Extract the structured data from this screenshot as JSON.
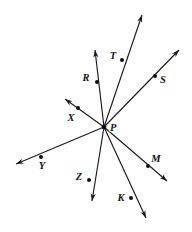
{
  "figure": {
    "type": "geometry-diagram",
    "width": 192,
    "height": 232,
    "background_color": "#ffffff",
    "line_color": "#1a1a1a",
    "label_color": "#141414",
    "vertex": {
      "label": "P",
      "x": 104,
      "y": 127,
      "label_x": 110,
      "label_y": 131
    },
    "rays": [
      {
        "label": "R",
        "name": "ray-PR",
        "point_x": 97,
        "point_y": 82,
        "tip_x": 95,
        "tip_y": 50,
        "label_x": 86,
        "label_y": 81
      },
      {
        "label": "T",
        "name": "ray-PT",
        "point_x": 122,
        "point_y": 60,
        "tip_x": 142,
        "tip_y": 15,
        "label_x": 113,
        "label_y": 59
      },
      {
        "label": "S",
        "name": "ray-PS",
        "point_x": 155,
        "point_y": 76,
        "tip_x": 179,
        "tip_y": 50,
        "label_x": 163,
        "label_y": 83
      },
      {
        "label": "X",
        "name": "ray-PX",
        "point_x": 78,
        "point_y": 108,
        "tip_x": 65,
        "tip_y": 99,
        "label_x": 71,
        "label_y": 121
      },
      {
        "label": "Y",
        "name": "ray-PY",
        "point_x": 41,
        "point_y": 157,
        "tip_x": 16,
        "tip_y": 164,
        "label_x": 42,
        "label_y": 169
      },
      {
        "label": "Z",
        "name": "ray-PZ",
        "point_x": 89,
        "point_y": 180,
        "tip_x": 92,
        "tip_y": 201,
        "label_x": 79,
        "label_y": 180
      },
      {
        "label": "K",
        "name": "ray-PK",
        "point_x": 131,
        "point_y": 198,
        "tip_x": 146,
        "tip_y": 218,
        "label_x": 121,
        "label_y": 201
      },
      {
        "label": "M",
        "name": "ray-PM",
        "point_x": 148,
        "point_y": 166,
        "tip_x": 167,
        "tip_y": 181,
        "label_x": 156,
        "label_y": 162
      }
    ]
  }
}
